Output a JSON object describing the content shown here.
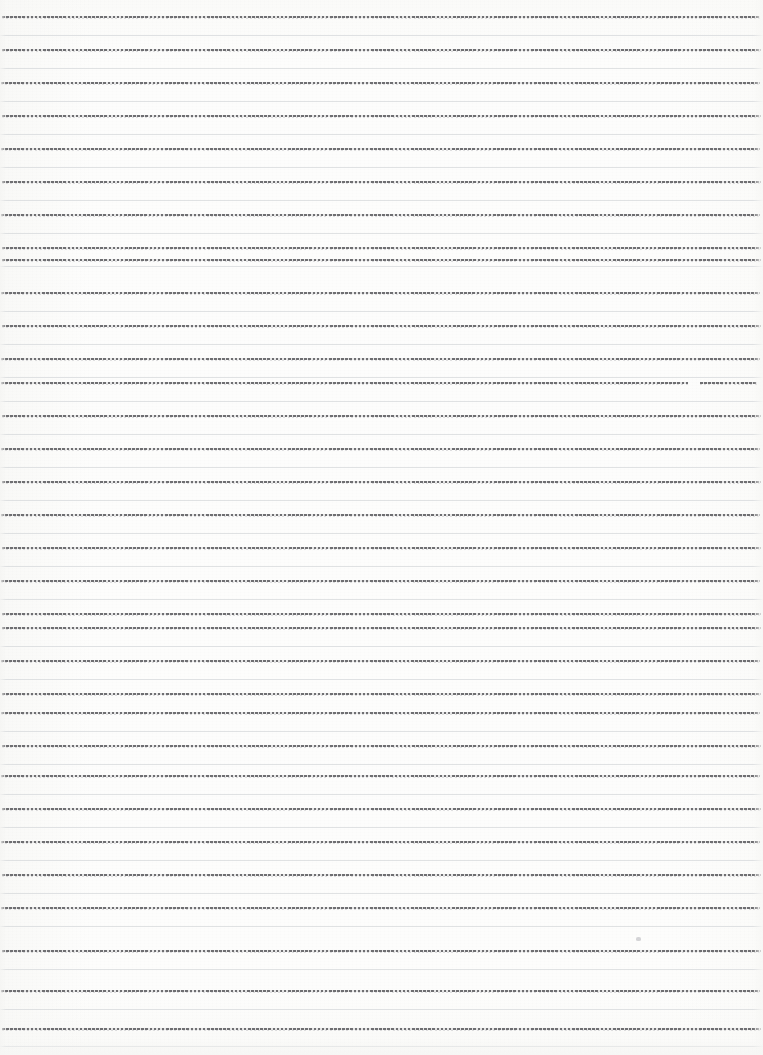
{
  "document": {
    "kind": "scanned-lined-paper",
    "title": "Blank ruled notebook page (scan)",
    "page_width": 763,
    "page_height": 1055,
    "has_text": false,
    "text_content": "",
    "background_color": "#fdfdfc",
    "rule_color": "#6f6f72",
    "faint_rule_color": "#d6d8db"
  },
  "ruling": {
    "rule_count": 32,
    "first_rule_y": 16,
    "rule_spacing": 32.7,
    "rule_left_x": 2,
    "dash_on_px": 2.6,
    "dash_off_px": 1.5,
    "faint_offset_y": 19,
    "rules": [
      {
        "y": 16,
        "x_start": 2,
        "x_end": 760,
        "break_start": null,
        "break_end": null
      },
      {
        "y": 49,
        "x_start": 2,
        "x_end": 761,
        "break_start": null,
        "break_end": null
      },
      {
        "y": 82,
        "x_start": 1,
        "x_end": 760,
        "break_start": null,
        "break_end": null
      },
      {
        "y": 115,
        "x_start": 2,
        "x_end": 761,
        "break_start": null,
        "break_end": null
      },
      {
        "y": 148,
        "x_start": 1,
        "x_end": 760,
        "break_start": null,
        "break_end": null
      },
      {
        "y": 181,
        "x_start": 2,
        "x_end": 761,
        "break_start": null,
        "break_end": null
      },
      {
        "y": 214,
        "x_start": 1,
        "x_end": 760,
        "break_start": null,
        "break_end": null
      },
      {
        "y": 247,
        "x_start": 2,
        "x_end": 761,
        "break_start": null,
        "break_end": null
      },
      {
        "y": 259,
        "x_start": 2,
        "x_end": 761,
        "break_start": null,
        "break_end": null
      },
      {
        "y": 292,
        "x_start": 1,
        "x_end": 760,
        "break_start": null,
        "break_end": null
      },
      {
        "y": 325,
        "x_start": 2,
        "x_end": 761,
        "break_start": null,
        "break_end": null
      },
      {
        "y": 358,
        "x_start": 1,
        "x_end": 760,
        "break_start": null,
        "break_end": null
      },
      {
        "y": 382,
        "x_start": 1,
        "x_end": 757,
        "break_start": 688,
        "break_end": 700
      },
      {
        "y": 415,
        "x_start": 2,
        "x_end": 761,
        "break_start": null,
        "break_end": null
      },
      {
        "y": 448,
        "x_start": 1,
        "x_end": 760,
        "break_start": null,
        "break_end": null
      },
      {
        "y": 481,
        "x_start": 2,
        "x_end": 761,
        "break_start": null,
        "break_end": null
      },
      {
        "y": 514,
        "x_start": 1,
        "x_end": 760,
        "break_start": null,
        "break_end": null
      },
      {
        "y": 547,
        "x_start": 2,
        "x_end": 761,
        "break_start": null,
        "break_end": null
      },
      {
        "y": 580,
        "x_start": 1,
        "x_end": 760,
        "break_start": null,
        "break_end": null
      },
      {
        "y": 613,
        "x_start": 2,
        "x_end": 761,
        "break_start": null,
        "break_end": null
      },
      {
        "y": 627,
        "x_start": 2,
        "x_end": 761,
        "break_start": null,
        "break_end": null
      },
      {
        "y": 660,
        "x_start": 1,
        "x_end": 760,
        "break_start": null,
        "break_end": null
      },
      {
        "y": 693,
        "x_start": 2,
        "x_end": 761,
        "break_start": null,
        "break_end": null
      },
      {
        "y": 712,
        "x_start": 1,
        "x_end": 760,
        "break_start": null,
        "break_end": null
      },
      {
        "y": 745,
        "x_start": 2,
        "x_end": 761,
        "break_start": null,
        "break_end": null
      },
      {
        "y": 775,
        "x_start": 1,
        "x_end": 760,
        "break_start": null,
        "break_end": null
      },
      {
        "y": 808,
        "x_start": 2,
        "x_end": 761,
        "break_start": null,
        "break_end": null
      },
      {
        "y": 841,
        "x_start": 1,
        "x_end": 760,
        "break_start": null,
        "break_end": null
      },
      {
        "y": 874,
        "x_start": 2,
        "x_end": 761,
        "break_start": null,
        "break_end": null
      },
      {
        "y": 907,
        "x_start": 1,
        "x_end": 760,
        "break_start": null,
        "break_end": null
      },
      {
        "y": 950,
        "x_start": 2,
        "x_end": 761,
        "break_start": null,
        "break_end": null
      },
      {
        "y": 990,
        "x_start": 1,
        "x_end": 760,
        "break_start": null,
        "break_end": null
      },
      {
        "y": 1028,
        "x_start": 2,
        "x_end": 761,
        "break_start": null,
        "break_end": null
      }
    ],
    "faint_rules_y": [
      35,
      68,
      101,
      134,
      167,
      200,
      233,
      266,
      311,
      344,
      377,
      401,
      434,
      467,
      500,
      533,
      566,
      599,
      646,
      679,
      731,
      764,
      794,
      827,
      860,
      893,
      926,
      969,
      1009,
      1046
    ]
  },
  "marks": [
    {
      "name": "pencil-smudge",
      "x": 636,
      "y": 937,
      "w": 5,
      "h": 4
    }
  ]
}
